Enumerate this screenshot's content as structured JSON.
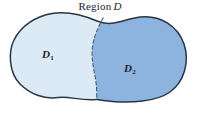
{
  "figure": {
    "title_prefix": "Region",
    "title_variable": "D",
    "background_color": "#ffffff",
    "outline_color": "#2a3544",
    "divider_color": "#4a5a70"
  },
  "regions": [
    {
      "id": "d1",
      "label_base": "D",
      "label_sub": "1",
      "fill_color": "#dbeaf4",
      "position": "left"
    },
    {
      "id": "d2",
      "label_base": "D",
      "label_sub": "2",
      "fill_color": "#8cb4de",
      "position": "right"
    }
  ],
  "shapes": {
    "outer_outline": "M 96.5 99.5 C 80 101 70 96 58 97.5 C 44 99.5 30 94 20 84 C 9 73 8 52 14 40 C 21 26 36 16 52 13.5 C 68 11 84 15.5 97 21 C 112 27.5 124 19 140 17 C 160 14.5 178 26 184 44 C 190 62 184 82 170 92 C 156 102 130 103 112 101.5 C 106 101 101 100.2 96.5 99.5 Z",
    "divider": "M 103.2 17.8 C 98 28 94 36 92.6 46 C 91.2 56 93 66 95 76 C 96.6 84 97 92 96.5 99.5"
  }
}
